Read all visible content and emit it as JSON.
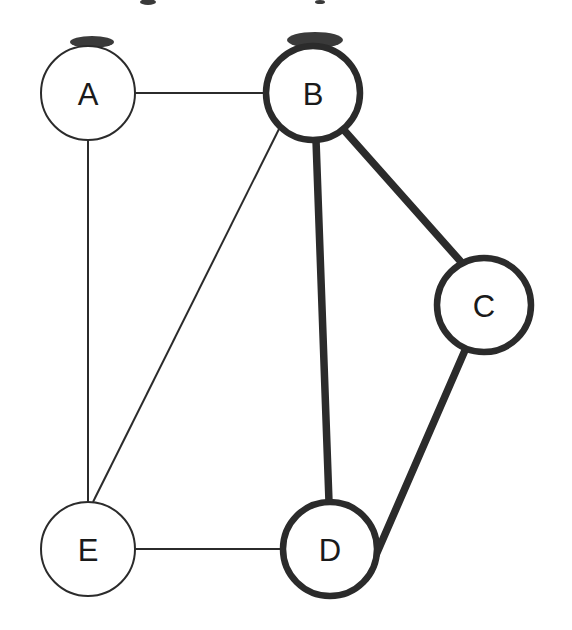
{
  "diagram": {
    "type": "undirected-graph",
    "title": "",
    "background_color": "#ffffff",
    "ink_color": "#2b2b2b",
    "label_color": "#1a1a1a",
    "canvas": {
      "width": 572,
      "height": 630
    },
    "node_radius": 47,
    "thin_stroke_width": 2,
    "thick_stroke_width": 6.5,
    "thin_edge_width": 2,
    "thick_edge_width": 7.5
  },
  "nodes": [
    {
      "id": "A",
      "label": "A",
      "cx": 88,
      "cy": 93,
      "r": 47,
      "emphasis": "normal",
      "stroke_width": 2
    },
    {
      "id": "B",
      "label": "B",
      "cx": 313,
      "cy": 93,
      "r": 47,
      "emphasis": "bold",
      "stroke_width": 6.5
    },
    {
      "id": "C",
      "label": "C",
      "cx": 484,
      "cy": 305,
      "r": 47,
      "emphasis": "bold",
      "stroke_width": 6.5
    },
    {
      "id": "D",
      "label": "D",
      "cx": 330,
      "cy": 549,
      "r": 47,
      "emphasis": "bold",
      "stroke_width": 6.5
    },
    {
      "id": "E",
      "label": "E",
      "cx": 88,
      "cy": 549,
      "r": 47,
      "emphasis": "normal",
      "stroke_width": 2
    }
  ],
  "edges": [
    {
      "id": "A-B",
      "source": "A",
      "target": "B",
      "emphasis": "normal",
      "stroke_width": 2,
      "x1": 135,
      "y1": 93,
      "x2": 266,
      "y2": 93
    },
    {
      "id": "A-E",
      "source": "A",
      "target": "E",
      "emphasis": "normal",
      "stroke_width": 2,
      "x1": 88,
      "y1": 140,
      "x2": 88,
      "y2": 502
    },
    {
      "id": "B-E",
      "source": "B",
      "target": "E",
      "emphasis": "normal",
      "stroke_width": 2,
      "x1": 280,
      "y1": 127,
      "x2": 93,
      "y2": 502
    },
    {
      "id": "E-D",
      "source": "E",
      "target": "D",
      "emphasis": "normal",
      "stroke_width": 2,
      "x1": 135,
      "y1": 549,
      "x2": 283,
      "y2": 549
    },
    {
      "id": "B-C",
      "source": "B",
      "target": "C",
      "emphasis": "bold",
      "stroke_width": 7.5,
      "x1": 343,
      "y1": 129,
      "x2": 462,
      "y2": 263
    },
    {
      "id": "B-D",
      "source": "B",
      "target": "D",
      "emphasis": "bold",
      "stroke_width": 7.5,
      "x1": 316,
      "y1": 140,
      "x2": 329,
      "y2": 502
    },
    {
      "id": "C-D",
      "source": "C",
      "target": "D",
      "emphasis": "bold",
      "stroke_width": 7.5,
      "x1": 466,
      "y1": 348,
      "x2": 366,
      "y2": 578
    }
  ],
  "scan_artifacts": [
    {
      "id": "artifact-1",
      "cx": 148,
      "cy": 2,
      "rx": 8,
      "ry": 3
    },
    {
      "id": "artifact-2",
      "cx": 320,
      "cy": 2,
      "rx": 5,
      "ry": 2
    },
    {
      "id": "artifact-3",
      "cx": 92,
      "cy": 42,
      "rx": 22,
      "ry": 6
    },
    {
      "id": "artifact-4",
      "cx": 315,
      "cy": 40,
      "rx": 28,
      "ry": 8
    }
  ]
}
